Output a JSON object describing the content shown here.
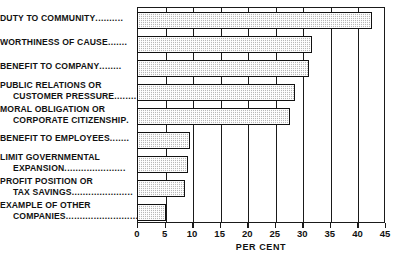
{
  "chart_data": {
    "type": "bar",
    "orientation": "horizontal",
    "title": "",
    "xlabel": "PER CENT",
    "ylabel": "",
    "xlim": [
      0,
      45
    ],
    "xticks": [
      0,
      5,
      10,
      15,
      20,
      25,
      30,
      35,
      40,
      45
    ],
    "grid": true,
    "legend": null,
    "categories": [
      "DUTY TO COMMUNITY",
      "WORTHINESS OF CAUSE",
      "BENEFIT TO COMPANY",
      "PUBLIC RELATIONS OR CUSTOMER PRESSURE",
      "MORAL OBLIGATION OR CORPORATE CITIZENSHIP",
      "BENEFIT TO EMPLOYEES",
      "LIMIT GOVERNMENTAL EXPANSION",
      "PROFIT POSITION OR TAX SAVINGS",
      "EXAMPLE OF OTHER COMPANIES"
    ],
    "values": [
      42.5,
      31.5,
      31.0,
      28.5,
      27.5,
      9.5,
      9.0,
      8.5,
      5.0
    ]
  },
  "labels": [
    {
      "line1": "DUTY TO COMMUNITY",
      "line2": "",
      "dots": "..........",
      "dots2": ""
    },
    {
      "line1": "WORTHINESS OF CAUSE",
      "line2": "",
      "dots": ".......",
      "dots2": ""
    },
    {
      "line1": "BENEFIT TO COMPANY",
      "line2": "",
      "dots": "........",
      "dots2": ""
    },
    {
      "line1": "PUBLIC RELATIONS OR",
      "line2": "CUSTOMER PRESSURE",
      "dots": "",
      "dots2": "........"
    },
    {
      "line1": "MORAL OBLIGATION OR",
      "line2": "CORPORATE CITIZENSHIP",
      "dots": "",
      "dots2": "."
    },
    {
      "line1": "BENEFIT TO EMPLOYEES",
      "line2": "",
      "dots": ".......",
      "dots2": ""
    },
    {
      "line1": "LIMIT GOVERNMENTAL",
      "line2": "EXPANSION",
      "dots": "",
      "dots2": "......................"
    },
    {
      "line1": "PROFIT POSITION OR",
      "line2": "TAX SAVINGS",
      "dots": "",
      "dots2": "......................"
    },
    {
      "line1": "EXAMPLE OF OTHER",
      "line2": "COMPANIES",
      "dots": "",
      "dots2": ".........................."
    }
  ],
  "axis": {
    "tick_labels": [
      "0",
      "5",
      "10",
      "15",
      "20",
      "25",
      "30",
      "35",
      "40",
      "45"
    ],
    "title": "PER CENT"
  },
  "colors": {
    "bar_fill": "#b8b8b8",
    "bar_stroke": "#111111",
    "frame": "#1a1a1a",
    "background": "#ffffff",
    "text": "#111111"
  }
}
